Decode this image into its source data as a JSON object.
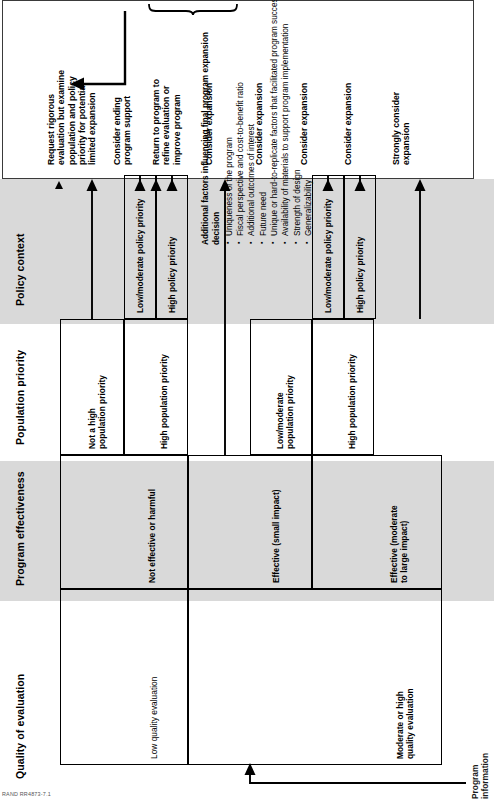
{
  "figure": {
    "entry_label": "Program\ninformation",
    "credit": "RAND RR4873-7.1"
  },
  "columns": [
    {
      "id": "quality-of-evaluation",
      "title": "Quality of evaluation",
      "shaded": false
    },
    {
      "id": "program-effectiveness",
      "title": "Program effectiveness",
      "shaded": true
    },
    {
      "id": "population-priority",
      "title": "Population priority",
      "shaded": false
    },
    {
      "id": "policy-context",
      "title": "Policy context",
      "shaded": true
    },
    {
      "id": "decision",
      "title": "Decision",
      "shaded": false
    }
  ],
  "nodes": {
    "quality": [
      {
        "id": "low-quality-evaluation",
        "label": "Low quality evaluation"
      },
      {
        "id": "moderate-or-high-quality-evaluation",
        "label": "Moderate or high\nquality evaluation"
      }
    ],
    "effectiveness": [
      {
        "id": "not-effective-or-harmful",
        "label": "Not effective or harmful"
      },
      {
        "id": "effective-small-impact",
        "label": "Effective (small impact)"
      },
      {
        "id": "effective-moderate-to-large-impact",
        "label": "Effective (moderate\nto large impact)"
      }
    ],
    "population": [
      {
        "id": "not-a-high-population-priority",
        "label": "Not a high\npopulation priority"
      },
      {
        "id": "high-population-priority-1",
        "label": "High population priority"
      },
      {
        "id": "low-moderate-population-priority",
        "label": "Low/moderate\npopulation priority"
      },
      {
        "id": "high-population-priority-2",
        "label": "High population priority"
      }
    ],
    "policy": [
      {
        "id": "low-moderate-policy-priority-1",
        "label": "Low/moderate policy priority"
      },
      {
        "id": "high-policy-priority-1",
        "label": "High policy priority"
      },
      {
        "id": "low-moderate-policy-priority-2",
        "label": "Low/moderate policy priority"
      },
      {
        "id": "high-policy-priority-2",
        "label": "High policy priority"
      }
    ]
  },
  "decisions": [
    {
      "id": "decision-1",
      "label": "Request rigorous\nevaluation but examine\npopulation and policy\npriority for potential\nlimited expansion"
    },
    {
      "id": "decision-2",
      "label": "Consider ending\nprogram support"
    },
    {
      "id": "decision-3",
      "label": "Return to program to\nrefine evaluation or\nimprove program"
    },
    {
      "id": "decision-4",
      "label": "Consider expansion"
    },
    {
      "id": "decision-5",
      "label": "Consider expansion"
    },
    {
      "id": "decision-6",
      "label": "Consider expansion"
    },
    {
      "id": "decision-7",
      "label": "Consider expansion"
    },
    {
      "id": "decision-8",
      "label": "Strongly consider\nexpansion"
    }
  ],
  "additional_factors": {
    "title": "Additional factors influencing final program expansion decision",
    "items": [
      "Uniqueness of the program",
      "Fiscal perspective and cost-to-benefit ratio",
      "Additional outcomes of interest",
      "Future need",
      "Unique or hard-to-replicate factors that facilitated program success",
      "Availability of materials to support program implementation",
      "Strength of design",
      "Generalizability"
    ]
  }
}
